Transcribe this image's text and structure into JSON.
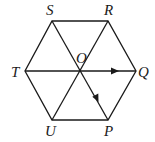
{
  "diagram": {
    "type": "regular-hexagon",
    "center": {
      "label": "O"
    },
    "vertices": [
      {
        "label": "S",
        "x": 52,
        "y": 21
      },
      {
        "label": "R",
        "x": 108,
        "y": 21
      },
      {
        "label": "Q",
        "x": 136,
        "y": 71
      },
      {
        "label": "P",
        "x": 108,
        "y": 120
      },
      {
        "label": "U",
        "x": 52,
        "y": 120
      },
      {
        "label": "T",
        "x": 25,
        "y": 71
      }
    ],
    "center_point": {
      "x": 80,
      "y": 71
    },
    "segments": [
      "SR",
      "RQ",
      "QP",
      "PU",
      "UT",
      "TS",
      "TQ",
      "SP",
      "RU"
    ],
    "vectors": [
      {
        "from": "O",
        "to": "Q"
      },
      {
        "from": "O",
        "to": "P"
      }
    ],
    "labels": {
      "S": "S",
      "R": "R",
      "Q": "Q",
      "P": "P",
      "U": "U",
      "T": "T",
      "O": "O"
    },
    "line_color": "#1a1a1a"
  }
}
